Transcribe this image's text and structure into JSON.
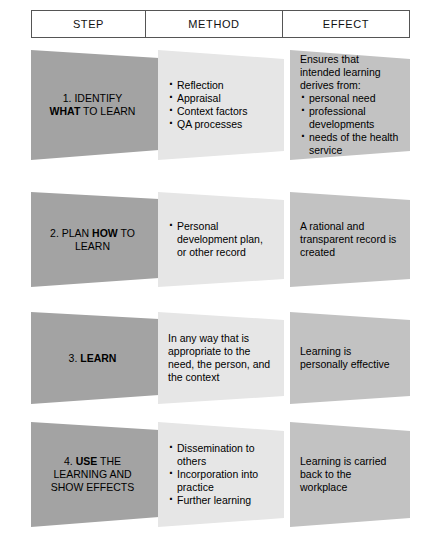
{
  "colors": {
    "step_fill": "#a3a3a3",
    "method_fill": "#e6e6e6",
    "effect_fill": "#c2c2c2",
    "border": "#555555",
    "text": "#000000"
  },
  "header": {
    "step": "STEP",
    "method": "METHOD",
    "effect": "EFFECT"
  },
  "rows": [
    {
      "step": {
        "number": "1.",
        "line1_a": " IDENTIFY",
        "line2_bold": "WHAT",
        "line2_rest": " TO LEARN",
        "full_text": "1. IDENTIFY WHAT TO LEARN"
      },
      "method": {
        "lead": "",
        "bullets": [
          "Reflection",
          "Appraisal",
          "Context factors",
          "QA processes"
        ]
      },
      "effect": {
        "lead": "Ensures that intended learning derives from:",
        "bullets": [
          "personal need",
          "professional developments",
          "needs of the health service"
        ]
      }
    },
    {
      "step": {
        "number": "2.",
        "line1_a": " PLAN ",
        "line2_bold": "HOW",
        "line2_rest": " TO LEARN",
        "full_text": "2. PLAN HOW TO LEARN"
      },
      "method": {
        "lead": "",
        "bullets": [
          "Personal development plan, or other record"
        ]
      },
      "effect": {
        "lead": "A rational and transparent record is created",
        "bullets": []
      }
    },
    {
      "step": {
        "number": "3.",
        "line1_a": " ",
        "line2_bold": "LEARN",
        "line2_rest": "",
        "full_text": "3. LEARN"
      },
      "method": {
        "lead": "In any way that is appropriate to the need, the person, and the context",
        "bullets": []
      },
      "effect": {
        "lead": "Learning is personally effective",
        "bullets": []
      }
    },
    {
      "step": {
        "number": "4.",
        "line1_a": " ",
        "line2_bold": "USE",
        "line2_rest": " THE LEARNING AND SHOW EFFECTS",
        "full_text": "4. USE THE LEARNING AND SHOW EFFECTS"
      },
      "method": {
        "lead": "",
        "bullets": [
          "Dissemination to others",
          "Incorporation into practice",
          "Further learning"
        ]
      },
      "effect": {
        "lead": "Learning is carried back to the workplace",
        "bullets": []
      }
    }
  ],
  "caption": ""
}
